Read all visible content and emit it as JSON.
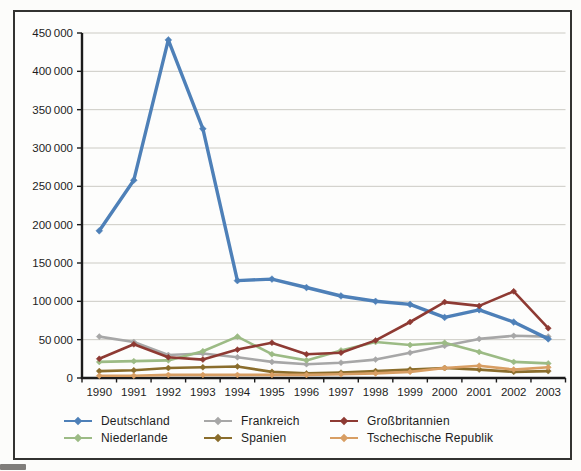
{
  "chart_data": {
    "type": "line",
    "title": "",
    "xlabel": "",
    "ylabel": "",
    "categories": [
      "1990",
      "1991",
      "1992",
      "1993",
      "1994",
      "1995",
      "1996",
      "1997",
      "1998",
      "1999",
      "2000",
      "2001",
      "2002",
      "2003"
    ],
    "ylim": [
      0,
      450000
    ],
    "ytick_step": 50000,
    "ytick_labels": [
      "0",
      "50 000",
      "100 000",
      "150 000",
      "200 000",
      "250 000",
      "300 000",
      "350 000",
      "400 000",
      "450 000"
    ],
    "grid": true,
    "legend_position": "bottom",
    "series": [
      {
        "id": "deutschland",
        "name": "Deutschland",
        "color": "#4e80b8",
        "values": [
          192000,
          258000,
          441000,
          325000,
          127000,
          129000,
          118000,
          107000,
          100000,
          96000,
          79000,
          89000,
          73000,
          51000
        ]
      },
      {
        "id": "frankreich",
        "name": "Frankreich",
        "color": "#a7a7a7",
        "values": [
          54000,
          47000,
          30000,
          32000,
          27000,
          21000,
          18000,
          20000,
          24000,
          33000,
          42000,
          51000,
          55000,
          54000
        ]
      },
      {
        "id": "grossbritannien",
        "name": "Großbritannien",
        "color": "#8e3a33",
        "values": [
          25000,
          44000,
          27000,
          24000,
          37000,
          46000,
          31000,
          33000,
          49000,
          73000,
          99000,
          94000,
          113000,
          65000
        ]
      },
      {
        "id": "niederlande",
        "name": "Niederlande",
        "color": "#9cbb85",
        "values": [
          21000,
          22000,
          23000,
          35000,
          54000,
          31000,
          23000,
          36000,
          47000,
          43000,
          46000,
          34000,
          21000,
          19000
        ]
      },
      {
        "id": "spanien",
        "name": "Spanien",
        "color": "#8a6d2c",
        "values": [
          9000,
          10000,
          13000,
          14000,
          15000,
          8000,
          6000,
          7000,
          9000,
          11000,
          13000,
          11000,
          8000,
          9000
        ]
      },
      {
        "id": "tschechische-republik",
        "name": "Tschechische Republik",
        "color": "#d89e63",
        "values": [
          3000,
          3000,
          4000,
          4000,
          4000,
          4000,
          4000,
          5000,
          6000,
          8000,
          13000,
          16000,
          11000,
          14000
        ]
      }
    ]
  },
  "legend": {
    "order": [
      0,
      1,
      2,
      3,
      4,
      5
    ]
  }
}
